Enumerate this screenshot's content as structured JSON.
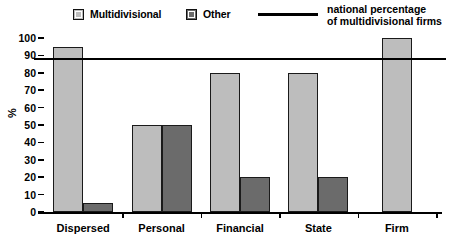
{
  "legend": {
    "multidivisional_label": "Multidivisional",
    "other_label": "Other",
    "line_label_line1": "national percentage",
    "line_label_line2": "of multidivisional firms"
  },
  "axis": {
    "y_title": "%",
    "y_ticks": [
      "100",
      "90",
      "80",
      "70",
      "60",
      "50",
      "40",
      "30",
      "20",
      "10",
      "0"
    ]
  },
  "colors": {
    "multidivisional_fill": "#bdbdbd",
    "other_fill": "#6b6b6b",
    "outline": "#1a1a1a",
    "reference_line": "#000000",
    "background": "#ffffff"
  },
  "chart_data": {
    "type": "bar",
    "title": "",
    "xlabel": "",
    "ylabel": "%",
    "ylim": [
      0,
      100
    ],
    "ytick_step": 10,
    "grid": false,
    "legend_position": "top",
    "categories": [
      "Dispersed",
      "Personal",
      "Financial",
      "State",
      "Firm"
    ],
    "series": [
      {
        "name": "Multidivisional",
        "color": "#bdbdbd",
        "values": [
          95,
          50,
          80,
          80,
          100
        ]
      },
      {
        "name": "Other",
        "color": "#6b6b6b",
        "values": [
          5,
          50,
          20,
          20,
          null
        ]
      }
    ],
    "reference_line": {
      "label": "national percentage of multidivisional firms",
      "value": 88,
      "orientation": "horizontal",
      "color": "#000000"
    }
  }
}
